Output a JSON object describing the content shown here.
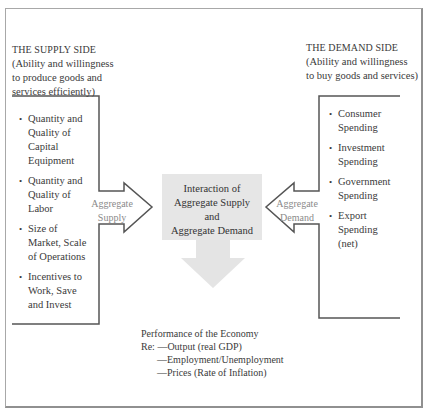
{
  "supply_side": {
    "heading": "THE SUPPLY SIDE",
    "description_lines": [
      "(Ability and willingness",
      "to produce goods and",
      "services efficiently)"
    ],
    "items": [
      {
        "lines": [
          "Quantity and",
          "Quality of",
          "Capital",
          "Equipment"
        ]
      },
      {
        "lines": [
          "Quantity and",
          "Quality of",
          "Labor"
        ]
      },
      {
        "lines": [
          "Size of",
          "Market, Scale",
          "of Operations"
        ]
      },
      {
        "lines": [
          "Incentives to",
          "Work, Save",
          "and Invest"
        ]
      }
    ],
    "arrow_label_lines": [
      "Aggregate",
      "Supply"
    ]
  },
  "demand_side": {
    "heading": "THE DEMAND SIDE",
    "description_lines": [
      "(Ability and willingness",
      "to buy goods and services)"
    ],
    "items": [
      {
        "lines": [
          "Consumer",
          "Spending"
        ]
      },
      {
        "lines": [
          "Investment",
          "Spending"
        ]
      },
      {
        "lines": [
          "Government",
          "Spending"
        ]
      },
      {
        "lines": [
          "Export",
          "Spending",
          "(net)"
        ]
      }
    ],
    "arrow_label_lines": [
      "Aggregate",
      "Demand"
    ]
  },
  "center": {
    "lines": [
      "Interaction of",
      "Aggregate Supply",
      "and",
      "Aggregate Demand"
    ]
  },
  "performance": {
    "title": "Performance of the Economy",
    "lines": [
      "Re: —Output (real GDP)",
      "—Employment/Unemployment",
      "—Prices (Rate of Inflation)"
    ]
  },
  "colors": {
    "line": "#555555",
    "center_fill": "#e6e6e6",
    "arrow_fill": "#e4e4e4",
    "frame": "#a0a0a0"
  },
  "icons": {
    "supply_arrow": "right-arrow-icon",
    "demand_arrow": "left-arrow-icon",
    "down_arrow": "down-arrow-icon"
  }
}
